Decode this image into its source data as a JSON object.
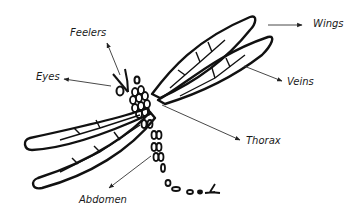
{
  "diagram": {
    "labels": {
      "feelers": "Feelers",
      "eyes": "Eyes",
      "wings": "Wings",
      "veins": "Veins",
      "thorax": "Thorax",
      "abdomen": "Abdomen"
    },
    "colors": {
      "ink": "#111111",
      "arrow": "#333333",
      "background": "#ffffff"
    }
  }
}
